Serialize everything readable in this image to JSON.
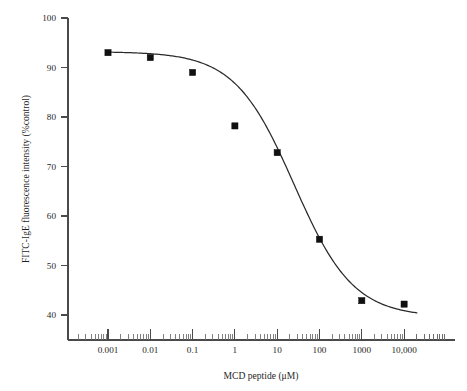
{
  "chart_data": {
    "type": "scatter",
    "title": "",
    "subtitle": "",
    "xlabel": "MCD peptide (μM)",
    "ylabel": "FITC-IgE fluorescence intensity (%control)",
    "xscale": "log",
    "yscale": "linear",
    "xlim": [
      0.0002,
      50000
    ],
    "ylim": [
      36,
      100
    ],
    "grid": false,
    "legend": null,
    "x_tick_labels": [
      "0.001",
      "0.01",
      "0.1",
      "1",
      "10",
      "100",
      "1000",
      "10,000"
    ],
    "x_tick_values": [
      0.001,
      0.01,
      0.1,
      1,
      10,
      100,
      1000,
      10000
    ],
    "y_tick_labels": [
      "40",
      "50",
      "60",
      "70",
      "80",
      "90",
      "100"
    ],
    "y_tick_values": [
      40,
      50,
      60,
      70,
      80,
      90,
      100
    ],
    "series": [
      {
        "name": "FITC-IgE fluorescence intensity",
        "marker": "filled-square",
        "marker_color": "#101010",
        "x": [
          0.001,
          0.01,
          0.1,
          1,
          10,
          100,
          1000,
          10000
        ],
        "y": [
          93.0,
          92.0,
          89.0,
          78.2,
          72.8,
          55.3,
          42.9,
          42.2
        ]
      },
      {
        "name": "sigmoidal fit curve",
        "type": "line",
        "line_color": "#2a2a2a",
        "fit": {
          "model": "four-parameter-logistic",
          "top": 93.2,
          "bottom": 39.6,
          "ic50": 25.0,
          "hill_slope": 0.62
        }
      }
    ],
    "annotations": []
  },
  "figure": {
    "background_color": "#ffffff",
    "axis_color": "#4a4a4a",
    "text_color": "#1f1f1f"
  }
}
